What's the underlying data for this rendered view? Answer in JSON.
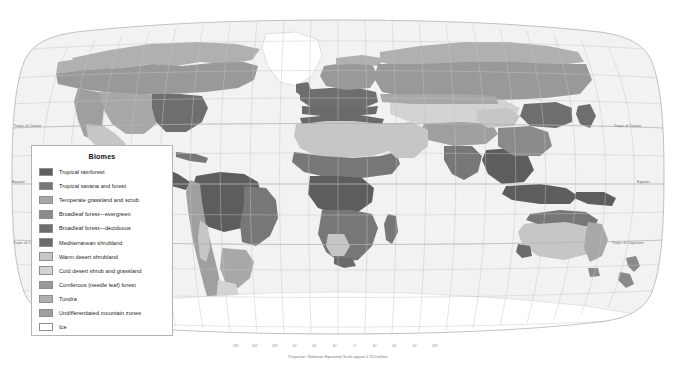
{
  "map": {
    "title": "World Biomes",
    "projection_note": "Projection: Robinson    Equatorial Scale approx 1:110 million",
    "ocean_color": "#f2f2f2",
    "graticule_color": "#bdbdbd",
    "outline_color": "#9a9a9a",
    "latitude_labels": [
      {
        "name": "Tropic of Cancer",
        "text": "Tropic of Cancer",
        "y": 128
      },
      {
        "name": "Equator",
        "text": "Equator",
        "y": 184
      },
      {
        "name": "Tropic of Capricorn",
        "text": "Tropic of Capricorn",
        "y": 240
      }
    ],
    "longitude_labels": [
      "180°",
      "150°",
      "120°",
      "90°",
      "60°",
      "30°",
      "0°",
      "30°",
      "60°",
      "90°",
      "120°",
      "150°",
      "180°"
    ]
  },
  "legend": {
    "title": "Biomes",
    "items": [
      {
        "label": "Tropical rainforest",
        "color": "#5d5d5d"
      },
      {
        "label": "Tropical savana and forest",
        "color": "#777777"
      },
      {
        "label": "Temperate grassland and scrub",
        "color": "#a8a8a8"
      },
      {
        "label": "Broadleaf forest—evergreen",
        "color": "#8a8a8a"
      },
      {
        "label": "Broadleaf forest—deciduous",
        "color": "#6e6e6e"
      },
      {
        "label": "Mediterranean shrubland",
        "color": "#6a6a6a"
      },
      {
        "label": "Warm desert shrubland",
        "color": "#c6c6c6"
      },
      {
        "label": "Cold desert shrub and grassland",
        "color": "#d3d3d3"
      },
      {
        "label": "Coniferous (needle leaf) forest",
        "color": "#999999"
      },
      {
        "label": "Tundra",
        "color": "#b0b0b0"
      },
      {
        "label": "Undifferentiated mountain zones",
        "color": "#9f9f9f"
      },
      {
        "label": "Ice",
        "color": "#ffffff"
      }
    ]
  }
}
